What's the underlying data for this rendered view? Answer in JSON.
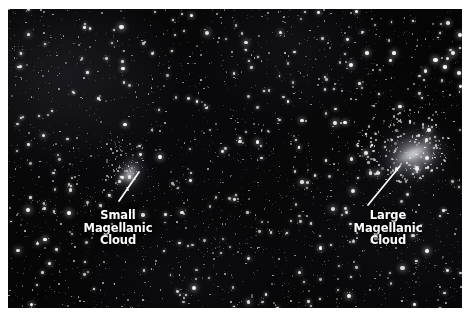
{
  "figure": {
    "kind": "astrophotography-starfield",
    "background_color": "#ffffff",
    "sky_color": "#020203",
    "annotation_color": "#ffffff"
  },
  "annotations": [
    {
      "id": "smc",
      "name": "small-magellanic-cloud",
      "lines": [
        "Small",
        "Magellanic",
        "Cloud"
      ],
      "leader": {
        "x1": 111,
        "y1": 192,
        "x2": 131,
        "y2": 163
      }
    },
    {
      "id": "lmc",
      "name": "large-magellanic-cloud",
      "lines": [
        "Large",
        "Magellanic",
        "Cloud"
      ],
      "leader": {
        "x1": 360,
        "y1": 196,
        "x2": 392,
        "y2": 157
      }
    }
  ],
  "objects": [
    {
      "id": "smc",
      "label": "Small Magellanic Cloud",
      "cx": 122,
      "cy": 165,
      "brightness": "faint"
    },
    {
      "id": "lmc",
      "label": "Large Magellanic Cloud",
      "cx": 404,
      "cy": 146,
      "brightness": "bright"
    }
  ]
}
